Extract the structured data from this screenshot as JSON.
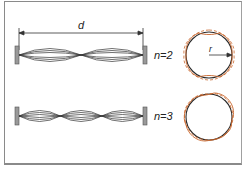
{
  "diagram": {
    "type": "standing-waves",
    "distance_label": "d",
    "radius_label": "r",
    "modes": [
      {
        "label": "n=2",
        "n": 2,
        "string_loops": 2
      },
      {
        "label": "n=3",
        "n": 3,
        "string_loops": 3
      }
    ],
    "colors": {
      "string": "#333333",
      "circle": "#2a2a2a",
      "wave": "#c8642a",
      "frame": "#8a8a8a",
      "support": "#999999"
    }
  }
}
